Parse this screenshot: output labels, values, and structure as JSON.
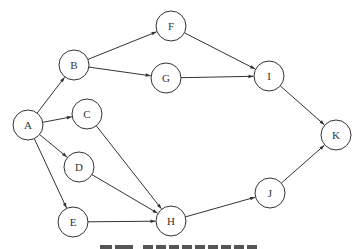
{
  "diagram": {
    "type": "directed-graph",
    "node_radius": 15,
    "stroke_color": "#333333",
    "label_color": "#333333",
    "nodes": [
      {
        "id": "A",
        "label": "A",
        "x": 28,
        "y": 125
      },
      {
        "id": "B",
        "label": "B",
        "x": 74,
        "y": 65
      },
      {
        "id": "C",
        "label": "C",
        "x": 87,
        "y": 114
      },
      {
        "id": "D",
        "label": "D",
        "x": 79,
        "y": 167
      },
      {
        "id": "E",
        "label": "E",
        "x": 73,
        "y": 222
      },
      {
        "id": "F",
        "label": "F",
        "x": 171,
        "y": 26
      },
      {
        "id": "G",
        "label": "G",
        "x": 166,
        "y": 78
      },
      {
        "id": "H",
        "label": "H",
        "x": 171,
        "y": 221
      },
      {
        "id": "I",
        "label": "I",
        "x": 269,
        "y": 76
      },
      {
        "id": "J",
        "label": "J",
        "x": 270,
        "y": 193
      },
      {
        "id": "K",
        "label": "K",
        "x": 336,
        "y": 135
      }
    ],
    "edges": [
      {
        "from": "A",
        "to": "B"
      },
      {
        "from": "A",
        "to": "C"
      },
      {
        "from": "A",
        "to": "D"
      },
      {
        "from": "A",
        "to": "E"
      },
      {
        "from": "B",
        "to": "F"
      },
      {
        "from": "B",
        "to": "G"
      },
      {
        "from": "C",
        "to": "H"
      },
      {
        "from": "D",
        "to": "H"
      },
      {
        "from": "E",
        "to": "H"
      },
      {
        "from": "F",
        "to": "I"
      },
      {
        "from": "G",
        "to": "I"
      },
      {
        "from": "H",
        "to": "J"
      },
      {
        "from": "I",
        "to": "K"
      },
      {
        "from": "J",
        "to": "K"
      }
    ]
  }
}
